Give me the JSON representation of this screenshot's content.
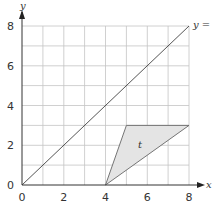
{
  "diagram": {
    "type": "coordinate-plane",
    "x_axis": {
      "label": "x",
      "min": 0,
      "max": 8,
      "ticks": [
        "0",
        "2",
        "4",
        "6",
        "8"
      ],
      "grid_step": 1
    },
    "y_axis": {
      "label": "y",
      "min": 0,
      "max": 8,
      "ticks": [
        "0",
        "2",
        "4",
        "6",
        "8"
      ],
      "grid_step": 1
    },
    "line": {
      "label": "y = x",
      "visible_label": "y = .",
      "from": [
        0,
        0
      ],
      "to": [
        8,
        8
      ]
    },
    "region": {
      "label": "t",
      "vertices": [
        [
          4,
          0
        ],
        [
          5,
          3
        ],
        [
          8,
          3
        ]
      ],
      "fill": "#e4e4e4",
      "stroke": "#666666"
    },
    "colors": {
      "grid": "#bdbdbd",
      "axis": "#333333",
      "line": "#555555"
    }
  }
}
